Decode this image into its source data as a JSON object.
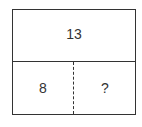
{
  "diagram": {
    "type": "part-whole bar model",
    "whole": "13",
    "parts": [
      "8",
      "?"
    ]
  }
}
